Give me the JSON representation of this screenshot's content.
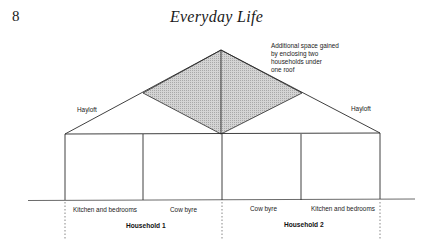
{
  "page": {
    "number": "8",
    "running_head": "Everyday Life"
  },
  "figure": {
    "annotation_lines": [
      "Additional space gained",
      "by enclosing two",
      "households under",
      "one roof"
    ],
    "hayloft_left": "Hayloft",
    "hayloft_right": "Hayloft",
    "rooms": [
      {
        "label": "Kitchen and bedrooms"
      },
      {
        "label": "Cow byre"
      },
      {
        "label": "Cow byre"
      },
      {
        "label": "Kitchen and bedrooms"
      }
    ],
    "households": [
      {
        "label": "Household 1"
      },
      {
        "label": "Household 2"
      }
    ],
    "colors": {
      "line": "#2a2a2a",
      "shaded": "#c8c8c8"
    }
  }
}
